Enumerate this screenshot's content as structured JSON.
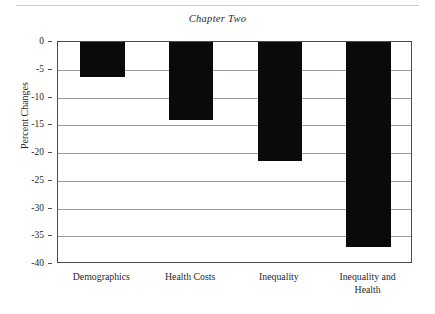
{
  "page": {
    "title": "Chapter Two",
    "top_rule": true
  },
  "chart_data": {
    "type": "bar",
    "title": "Chapter Two",
    "xlabel": "",
    "ylabel": "Percent Changes",
    "categories": [
      "Demographics",
      "Health Costs",
      "Inequality",
      "Inequality and Health"
    ],
    "category_lines": [
      [
        "Demographics"
      ],
      [
        "Health Costs"
      ],
      [
        "Inequality"
      ],
      [
        "Inequality and",
        "Health"
      ]
    ],
    "values": [
      -6.3,
      -14.0,
      -21.5,
      -37.0
    ],
    "ylim": [
      -40,
      0
    ],
    "ytick_values": [
      0,
      -5,
      -10,
      -15,
      -20,
      -25,
      -30,
      -35,
      -40
    ],
    "ytick_labels": [
      "0",
      "-5",
      "-10",
      "-15",
      "-20",
      "-25",
      "-30",
      "-35",
      "-40"
    ],
    "grid": true,
    "grid_axis": "y",
    "legend": "none",
    "bar_color": "#0a0a0a",
    "grid_color": "#9a9aa2",
    "frame_color": "#4a4a52"
  }
}
